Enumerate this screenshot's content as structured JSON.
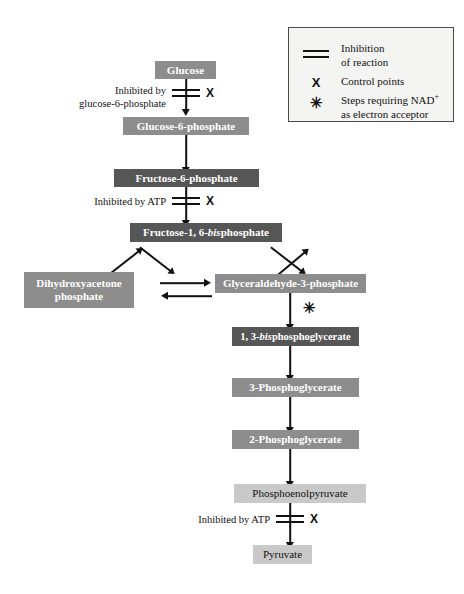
{
  "figure": {
    "background": "#ffffff",
    "colors": {
      "box_dark": "#565656",
      "box_mid": "#8d8d8d",
      "box_light": "#c9c9c9",
      "text_on_dark": "#ffffff",
      "text_on_light": "#111111",
      "arrow": "#111111",
      "legend_background": "#f4f4f2",
      "legend_border": "#4a4a4a"
    }
  },
  "legend": {
    "items": [
      {
        "symbol": "double-bar-icon",
        "line1": "Inhibition",
        "line2": "of reaction"
      },
      {
        "symbol": "x-icon",
        "line1": "Control points",
        "line2": ""
      },
      {
        "symbol": "asterisk-icon",
        "line1_pre": "Steps requiring NAD",
        "line1_sup": "+",
        "line2": "as electron acceptor"
      }
    ]
  },
  "nodes": [
    {
      "id": "glucose",
      "label": "Glucose",
      "shade": "mid"
    },
    {
      "id": "g6p",
      "label": "Glucose-6-phosphate",
      "shade": "mid"
    },
    {
      "id": "f6p",
      "label": "Fructose-6-phosphate",
      "shade": "dark"
    },
    {
      "id": "f16bp",
      "label_pre": "Fructose-1, 6-",
      "label_it": "bis",
      "label_post": "phosphate",
      "shade": "dark"
    },
    {
      "id": "dhap",
      "label_line1": "Dihydroxyacetone",
      "label_line2": "phosphate",
      "shade": "mid"
    },
    {
      "id": "gap",
      "label": "Glyceraldehyde-3-phosphate",
      "shade": "mid"
    },
    {
      "id": "bpg",
      "label_pre": "1, 3-",
      "label_it": "bis",
      "label_post": "phosphoglycerate",
      "shade": "dark"
    },
    {
      "id": "pg3",
      "label": "3-Phosphoglycerate",
      "shade": "mid"
    },
    {
      "id": "pg2",
      "label": "2-Phosphoglycerate",
      "shade": "mid"
    },
    {
      "id": "pep",
      "label": "Phosphoenolpyruvate",
      "shade": "light"
    },
    {
      "id": "pyruvate",
      "label": "Pyruvate",
      "shade": "light"
    }
  ],
  "annotations": {
    "inhibit_glucose_line1": "Inhibited by",
    "inhibit_glucose_line2": "glucose-6-phosphate",
    "inhibit_f6p": "Inhibited by ATP",
    "inhibit_pep": "Inhibited by ATP",
    "control_point_marker": "X",
    "nad_marker": "✳"
  }
}
